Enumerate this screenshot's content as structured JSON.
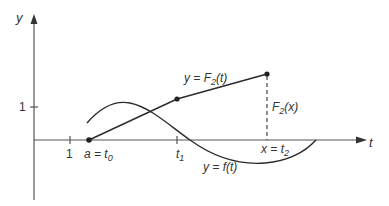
{
  "diagram": {
    "type": "function-plot",
    "axes": {
      "x_label": "t",
      "y_label": "y",
      "x_tick_label": "1",
      "y_tick_label": "1"
    },
    "points": {
      "t0": {
        "label_main": "a = t",
        "label_sub": "0"
      },
      "t1": {
        "label_main": "t",
        "label_sub": "1"
      },
      "t2": {
        "label_main": "x = t",
        "label_sub": "2"
      }
    },
    "curves": {
      "F2": {
        "label_main": "y = F",
        "label_sub": "2",
        "label_tail": "(t)",
        "style": "polyline"
      },
      "f": {
        "label": "y = f(t)",
        "style": "smooth"
      }
    },
    "annotations": {
      "F2x": {
        "label_main": "F",
        "label_sub": "2",
        "label_tail": "(x)"
      }
    },
    "colors": {
      "stroke": "#2b2b2b",
      "axis": "#555555",
      "text": "#333333",
      "background": "#ffffff"
    }
  }
}
